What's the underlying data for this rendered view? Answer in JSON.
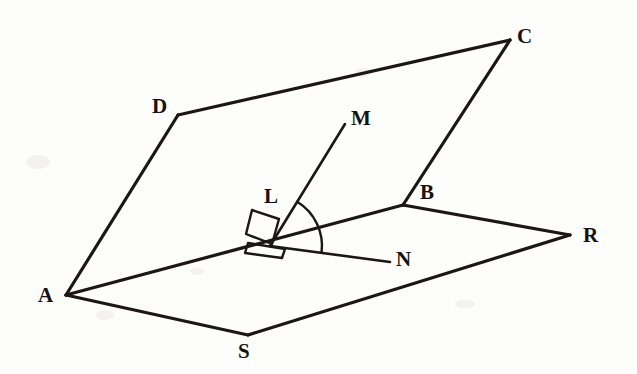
{
  "figure": {
    "background_color": "#fdfdfc",
    "stroke_color": "#1a1714",
    "label_color": "#15130f",
    "width": 637,
    "height": 374
  },
  "points": {
    "A": {
      "label": "A",
      "x": 66,
      "y": 295,
      "label_x": 38,
      "label_y": 285
    },
    "B": {
      "label": "B",
      "x": 403,
      "y": 205,
      "label_x": 420,
      "label_y": 182
    },
    "C": {
      "label": "C",
      "x": 510,
      "y": 40,
      "label_x": 517,
      "label_y": 26
    },
    "D": {
      "label": "D",
      "x": 178,
      "y": 115,
      "label_x": 152,
      "label_y": 96
    },
    "L": {
      "label": "L",
      "x": 252,
      "y": 228,
      "label_x": 264,
      "label_y": 186
    },
    "M": {
      "label": "M",
      "x": 345,
      "y": 124,
      "label_x": 351,
      "label_y": 108
    },
    "N": {
      "label": "N",
      "x": 390,
      "y": 262,
      "label_x": 396,
      "label_y": 249
    },
    "R": {
      "label": "R",
      "x": 570,
      "y": 235,
      "label_x": 583,
      "label_y": 225
    },
    "S": {
      "label": "S",
      "x": 248,
      "y": 335,
      "label_x": 238,
      "label_y": 341
    },
    "O": {
      "label": "",
      "x": 270,
      "y": 246,
      "label_x": 0,
      "label_y": 0
    }
  },
  "edges": [
    {
      "name": "edge-A-D",
      "from": "A",
      "to": "D",
      "width": 3.2
    },
    {
      "name": "edge-D-C",
      "from": "D",
      "to": "C",
      "width": 3.2
    },
    {
      "name": "edge-C-B",
      "from": "C",
      "to": "B",
      "width": 3.2
    },
    {
      "name": "edge-A-B",
      "from": "A",
      "to": "B",
      "width": 3.2
    },
    {
      "name": "edge-A-S",
      "from": "A",
      "to": "S",
      "width": 3.2
    },
    {
      "name": "edge-S-R",
      "from": "S",
      "to": "R",
      "width": 3.2
    },
    {
      "name": "edge-B-R",
      "from": "B",
      "to": "R",
      "width": 3.2
    },
    {
      "name": "ray-O-M",
      "from": "O",
      "to": "M",
      "width": 2.6
    },
    {
      "name": "ray-O-N",
      "from": "O",
      "to": "N",
      "width": 2.6
    }
  ],
  "angle_arc": {
    "name": "angle-M-O-N",
    "center": "O",
    "radius": 52,
    "from_point": "M",
    "to_point": "N",
    "stroke_width": 2.4
  },
  "right_angle_markers": [
    {
      "name": "right-angle-marker-upper",
      "points": "252,210 279,219 272,244 246,234"
    },
    {
      "name": "right-angle-marker-lower",
      "points": "248,243 285,249 282,258 245,253"
    }
  ],
  "labels_order": [
    "C",
    "D",
    "M",
    "L",
    "B",
    "R",
    "N",
    "A",
    "S"
  ],
  "annotations": {
    "upper_plane": "ADCB",
    "lower_plane": "ASRB",
    "common_line": "AB",
    "perpendicular_ray": "LM",
    "in_plane_ray": "LN"
  }
}
